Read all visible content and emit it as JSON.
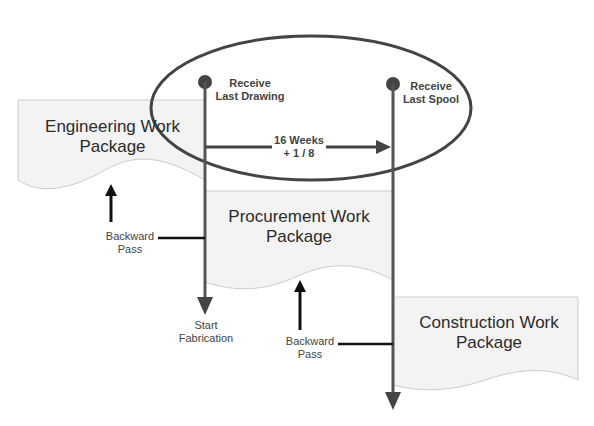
{
  "diagram": {
    "packages": [
      {
        "id": "engineering",
        "line1": "Engineering Work",
        "line2": "Package"
      },
      {
        "id": "procurement",
        "line1": "Procurement Work",
        "line2": "Package"
      },
      {
        "id": "construction",
        "line1": "Construction Work",
        "line2": "Package"
      }
    ],
    "milestones": [
      {
        "id": "last-drawing",
        "line1": "Receive",
        "line2": "Last Drawing"
      },
      {
        "id": "last-spool",
        "line1": "Receive",
        "line2": "Last Spool"
      }
    ],
    "duration": {
      "line1": "16 Weeks",
      "line2": "+ 1 / 8"
    },
    "backward_pass": [
      {
        "line1": "Backward",
        "line2": "Pass"
      },
      {
        "line1": "Backward",
        "line2": "Pass"
      }
    ],
    "start_fabrication": {
      "line1": "Start",
      "line2": "Fabrication"
    },
    "colors": {
      "package_fill": "#f3f3f3",
      "package_stroke": "#cccccc",
      "timeline": "#555555",
      "ellipse": "#444444",
      "arrow": "#111111"
    }
  }
}
